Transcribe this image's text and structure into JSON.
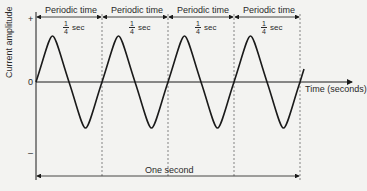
{
  "diagram": {
    "y_axis_label": "Current amplitude",
    "x_axis_label": "Time (seconds)",
    "y_ticks": {
      "plus": "+",
      "zero": "0",
      "minus": "–"
    },
    "periods": [
      {
        "label": "Periodic time",
        "fraction_num": "1",
        "fraction_den": "4",
        "unit": "sec"
      },
      {
        "label": "Periodic time",
        "fraction_num": "1",
        "fraction_den": "4",
        "unit": "sec"
      },
      {
        "label": "Periodic time",
        "fraction_num": "1",
        "fraction_den": "4",
        "unit": "sec"
      },
      {
        "label": "Periodic time",
        "fraction_num": "1",
        "fraction_den": "4",
        "unit": "sec"
      }
    ],
    "total_span_label": "One second",
    "cycles": 4,
    "wave_type": "sine",
    "colors": {
      "line": "#1a1a1a",
      "background": "#f3f3f1"
    }
  }
}
